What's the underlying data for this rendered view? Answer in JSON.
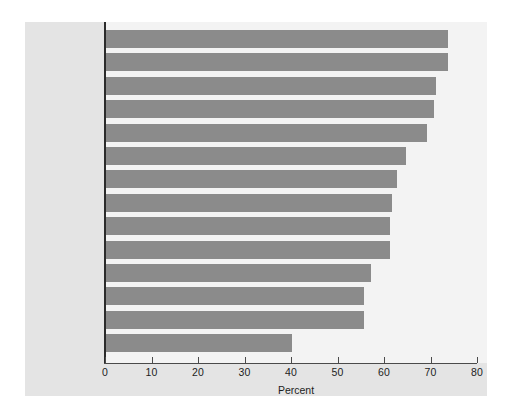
{
  "chart_data": {
    "type": "bar",
    "orientation": "horizontal",
    "title": "",
    "subtitle": "",
    "xlabel": "Percent",
    "ylabel": "",
    "xlim": [
      0,
      80
    ],
    "xticks": [
      0,
      10,
      20,
      30,
      40,
      50,
      60,
      70,
      80
    ],
    "grid": false,
    "legend": null,
    "categories": [
      "Korea",
      "Taiwan",
      "Switzerland",
      "Soviet Union,\nformer",
      "Hungary",
      "France",
      "Israel",
      "Canada",
      "Scotland",
      "Ireland",
      "Slovenia",
      "Spain",
      "United States",
      "Jordan"
    ],
    "values": [
      73.5,
      73.5,
      71,
      70.5,
      69,
      64.5,
      62.5,
      61.5,
      61,
      61,
      57,
      55.5,
      55.5,
      40
    ],
    "bar_color": "#8b8b8b",
    "plot_background": "#f3f3f3",
    "panel_background": "#e4e4e4",
    "axis_color": "#2b2b2b"
  },
  "axis": {
    "tick_labels": [
      "0",
      "10",
      "20",
      "30",
      "40",
      "50",
      "60",
      "70",
      "80"
    ],
    "title": "Percent"
  }
}
